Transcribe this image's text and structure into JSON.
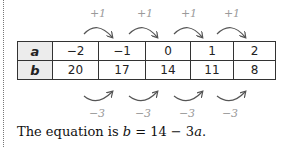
{
  "table": {
    "rows": [
      {
        "header": "a",
        "values": [
          "−2",
          "−1",
          "0",
          "1",
          "2"
        ]
      },
      {
        "header": "b",
        "values": [
          "20",
          "17",
          "14",
          "11",
          "8"
        ]
      }
    ]
  },
  "top_steps": [
    "+1",
    "+1",
    "+1",
    "+1"
  ],
  "bottom_steps": [
    "−3",
    "−3",
    "−3",
    "−3"
  ],
  "equation": {
    "prefix": "The equation is ",
    "lhs": "b",
    "middle": " = 14 − 3",
    "var": "a",
    "suffix": "."
  },
  "colors": {
    "step_label": "#9a9a9a",
    "arc": "#555555",
    "header_fill": "#ececec"
  }
}
